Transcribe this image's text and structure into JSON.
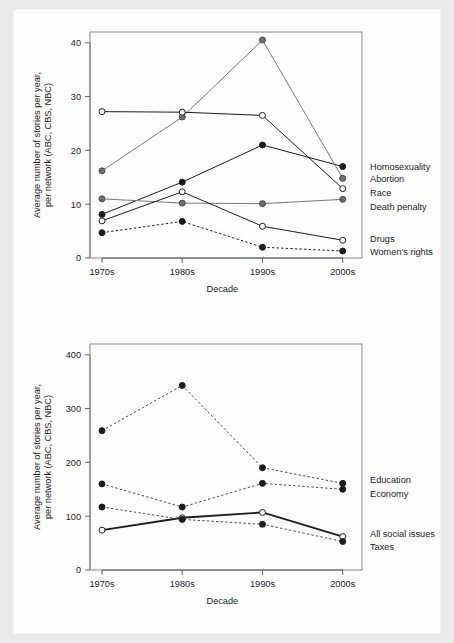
{
  "page": {
    "background_color": "#fdfdfd",
    "scan_border_color": "#e9e9e9"
  },
  "chart_data": [
    {
      "id": "social-issues-detail",
      "type": "line",
      "title": "",
      "xlabel": "Decade",
      "ylabel": "Average number of stories per year,\nper network (ABC, CBS, NBC)",
      "ylabel_line1": "Average number of stories per year,",
      "ylabel_line2": "per network (ABC, CBS, NBC)",
      "categories": [
        "1970s",
        "1980s",
        "1990s",
        "2000s"
      ],
      "yticks": [
        0,
        10,
        20,
        30,
        40
      ],
      "ytick_labels": [
        "0",
        "10",
        "20",
        "30",
        "40"
      ],
      "ylim": [
        0,
        42
      ],
      "grid": false,
      "legend_position": "right-inline",
      "series": [
        {
          "name": "Homosexuality",
          "values": [
            8.1,
            14.1,
            21.0,
            17.0
          ],
          "marker": "filled-black",
          "line": "solid",
          "color": "#1c1c1c",
          "label_y": 17.0
        },
        {
          "name": "Abortion",
          "values": [
            16.2,
            26.2,
            40.5,
            14.8
          ],
          "marker": "filled-gray",
          "line": "solid",
          "color": "#777777",
          "label_y": 14.8
        },
        {
          "name": "Race",
          "values": [
            27.2,
            27.1,
            26.5,
            12.9
          ],
          "marker": "open",
          "line": "solid",
          "color": "#1c1c1c",
          "label_y": 12.2
        },
        {
          "name": "Death penalty",
          "values": [
            11.0,
            10.2,
            10.1,
            10.9
          ],
          "marker": "filled-gray",
          "line": "solid",
          "color": "#777777",
          "label_y": 9.6
        },
        {
          "name": "Drugs",
          "values": [
            6.9,
            12.3,
            5.9,
            3.3
          ],
          "marker": "open",
          "line": "solid",
          "color": "#1c1c1c",
          "label_y": 3.6
        },
        {
          "name": "Women's rights",
          "values": [
            4.7,
            6.8,
            2.0,
            1.3
          ],
          "marker": "filled-black",
          "line": "dashed",
          "color": "#1c1c1c",
          "label_y": 1.1
        }
      ]
    },
    {
      "id": "social-issues-overall",
      "type": "line",
      "title": "",
      "xlabel": "Decade",
      "ylabel": "Average number of stories per year,\nper network (ABC, CBS, NBC)",
      "ylabel_line1": "Average number of stories per year,",
      "ylabel_line2": "per network (ABC, CBS, NBC)",
      "categories": [
        "1970s",
        "1980s",
        "1990s",
        "2000s"
      ],
      "yticks": [
        0,
        100,
        200,
        300,
        400
      ],
      "ytick_labels": [
        "0",
        "100",
        "200",
        "300",
        "400"
      ],
      "ylim": [
        0,
        420
      ],
      "grid": false,
      "legend_position": "right-inline",
      "series": [
        {
          "name": "Education",
          "values": [
            259,
            343,
            190,
            161
          ],
          "marker": "filled-black",
          "line": "dashed",
          "color": "#4a4a4a",
          "label_y": 168
        },
        {
          "name": "Economy",
          "values": [
            160,
            117,
            161,
            150
          ],
          "marker": "filled-black",
          "line": "dashed",
          "color": "#4a4a4a",
          "label_y": 142
        },
        {
          "name": "All social issues",
          "values": [
            74,
            97,
            107,
            62
          ],
          "marker": "open",
          "line": "solid-thick",
          "color": "#1c1c1c",
          "label_y": 68
        },
        {
          "name": "Taxes",
          "values": [
            117,
            94,
            85,
            53
          ],
          "marker": "filled-black",
          "line": "dashed",
          "color": "#4a4a4a",
          "label_y": 44
        }
      ]
    }
  ]
}
